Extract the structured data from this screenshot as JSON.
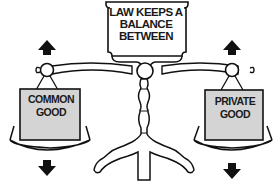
{
  "title": {
    "line1": "LAW KEEPS A",
    "line2": "BALANCE",
    "line3": "BETWEEN"
  },
  "left_pan": {
    "line1": "COMMON",
    "line2": "GOOD",
    "arrow_up": "arrow-up-icon",
    "arrow_down": "arrow-down-icon"
  },
  "right_pan": {
    "line1": "PRIVATE",
    "line2": "GOOD",
    "arrow_up": "arrow-up-icon",
    "arrow_down": "arrow-down-icon"
  },
  "colors": {
    "ink": "#111111",
    "box_fill": "#d4d4d4",
    "background": "#ffffff"
  }
}
